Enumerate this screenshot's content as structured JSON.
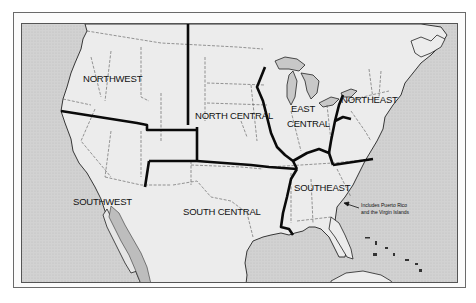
{
  "map": {
    "title": "",
    "colors": {
      "ocean": "#cfcfcf",
      "land": "#ececec",
      "mexico_land": "#e6e6e6",
      "gulf_of_california": "#bdbdbd",
      "region_border": "#0a0a0a",
      "state_border": "#555555",
      "frame": "#6a6a6a"
    },
    "regions": [
      {
        "id": "northwest",
        "label": "NORTHWEST"
      },
      {
        "id": "north-central",
        "label": "NORTH CENTRAL"
      },
      {
        "id": "east-central",
        "label_line1": "EAST",
        "label_line2": "CENTRAL"
      },
      {
        "id": "northeast",
        "label": "NORTHEAST"
      },
      {
        "id": "southwest",
        "label": "SOUTHWEST"
      },
      {
        "id": "south-central",
        "label": "SOUTH CENTRAL"
      },
      {
        "id": "southeast",
        "label": "SOUTHEAST"
      }
    ],
    "annotation": {
      "line1": "Includes Puerto Rico",
      "line2": "and the Virgin Islands"
    }
  }
}
